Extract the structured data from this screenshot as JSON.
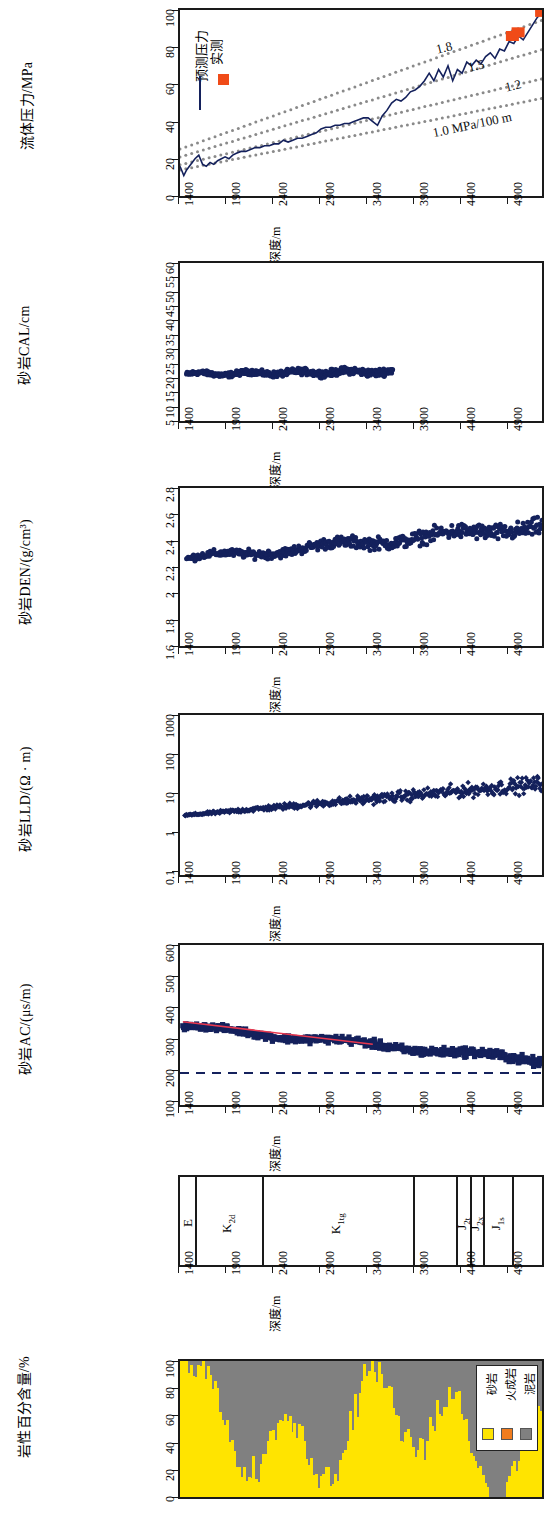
{
  "figure": {
    "orientation": "rotated-90",
    "depth_axis": {
      "label": "深度/m",
      "ticks": [
        1400,
        1900,
        2400,
        2900,
        3400,
        3900,
        4400,
        4900
      ],
      "min": 1400,
      "max": 5250
    },
    "colors": {
      "curve": "#14215c",
      "marker_measured": "#f04b18",
      "trend": "#e8384f",
      "sandstone": "#ffe400",
      "mudstone": "#808080",
      "igneous": "#f07c1e",
      "axis": "#1a1a1a"
    }
  },
  "panels": [
    {
      "id": "pressure",
      "ylabel": "流体压力/MPa",
      "yticks": [
        "0",
        "20",
        "40",
        "60",
        "80",
        "100"
      ],
      "ymin": 0,
      "ymax": 100,
      "legend": [
        {
          "label": "预测压力",
          "symbol": "line"
        },
        {
          "label": "实测",
          "symbol": "square"
        }
      ],
      "annotations": [
        {
          "text": "1.8"
        },
        {
          "text": "1.5"
        },
        {
          "text": "1.2"
        },
        {
          "text": "1.0 MPa/100 m"
        }
      ]
    },
    {
      "id": "cal",
      "ylabel": "砂岩CAL/cm",
      "yticks": [
        "5",
        "10",
        "15",
        "20",
        "25",
        "30",
        "35",
        "40",
        "45",
        "50",
        "55",
        "60"
      ],
      "ymin": 5,
      "ymax": 60
    },
    {
      "id": "den",
      "ylabel": "砂岩DEN/(g/cm³)",
      "yticks": [
        "1.6",
        "1.8",
        "2",
        "2.2",
        "2.4",
        "2.6",
        "2.8"
      ],
      "ymin": 1.6,
      "ymax": 2.8
    },
    {
      "id": "lld",
      "ylabel": "砂岩LLD/(Ω · m)",
      "yticks": [
        "0.1",
        "1",
        "10",
        "100",
        "1000"
      ],
      "ymin": 0.1,
      "ymax": 1000,
      "scale": "log"
    },
    {
      "id": "ac",
      "ylabel": "砂岩AC/(μs/m)",
      "yticks": [
        "100",
        "200",
        "300",
        "400",
        "500",
        "600"
      ],
      "ymin": 100,
      "ymax": 600
    },
    {
      "id": "strata",
      "units": [
        {
          "label": "E",
          "sub": "",
          "top": 1400,
          "base": 1560
        },
        {
          "label": "K",
          "sub": "2d",
          "top": 1560,
          "base": 2270
        },
        {
          "label": "K",
          "sub": "1tg",
          "top": 2270,
          "base": 3880
        },
        {
          "label": "",
          "sub": "",
          "top": 3880,
          "base": 4330
        },
        {
          "label": "J",
          "sub": "2t",
          "top": 4330,
          "base": 4480
        },
        {
          "label": "J",
          "sub": "2x",
          "top": 4480,
          "base": 4620
        },
        {
          "label": "J",
          "sub": "1s",
          "top": 4620,
          "base": 4930
        },
        {
          "label": "",
          "sub": "",
          "top": 4930,
          "base": 5250
        }
      ]
    },
    {
      "id": "lithology",
      "ylabel": "岩性百分含量/%",
      "yticks": [
        "0",
        "20",
        "40",
        "60",
        "80",
        "100"
      ],
      "ymin": 0,
      "ymax": 100,
      "legend": [
        {
          "label": "砂岩",
          "color": "#ffe400"
        },
        {
          "label": "火成岩",
          "color": "#f07c1e"
        },
        {
          "label": "泥岩",
          "color": "#808080"
        }
      ]
    }
  ],
  "chart_data": {
    "type": "line",
    "title": "",
    "xlabel": "深度/m",
    "x_ticks": [
      1400,
      1900,
      2400,
      2900,
      3400,
      3900,
      4400,
      4900
    ],
    "xlim": [
      1400,
      5250
    ],
    "grid": false,
    "subplots": [
      {
        "id": "pressure",
        "type": "line",
        "ylabel": "流体压力/MPa",
        "ylim": [
          0,
          100
        ],
        "y_ticks": [
          0,
          20,
          40,
          60,
          80,
          100
        ],
        "legend": [
          "预测压力",
          "实测"
        ],
        "legend_position": "upper-left",
        "annotations": [
          "1.8",
          "1.5",
          "1.2",
          "1.0 MPa/100 m"
        ],
        "series": [
          {
            "name": "预测压力",
            "style": "line",
            "color": "#14215c",
            "x": [
              1400,
              1440,
              1470,
              1500,
              1530,
              1560,
              1600,
              1640,
              1680,
              1720,
              1760,
              1800,
              1840,
              1880,
              1920,
              1960,
              2000,
              2050,
              2100,
              2150,
              2200,
              2250,
              2300,
              2350,
              2400,
              2450,
              2500,
              2550,
              2600,
              2650,
              2700,
              2750,
              2800,
              2850,
              2900,
              2950,
              3000,
              3050,
              3100,
              3150,
              3200,
              3250,
              3300,
              3350,
              3400,
              3450,
              3500,
              3550,
              3600,
              3650,
              3700,
              3750,
              3800,
              3850,
              3900,
              3950,
              4000,
              4050,
              4100,
              4150,
              4200,
              4250,
              4300,
              4350,
              4400,
              4450,
              4500,
              4550,
              4600,
              4650,
              4700,
              4750,
              4800,
              4850,
              4900,
              4950,
              5000,
              5050,
              5100,
              5150,
              5200,
              5250
            ],
            "y": [
              16,
              11,
              14,
              16,
              18,
              20,
              22,
              17,
              16,
              18,
              17,
              19,
              20,
              21,
              20,
              22,
              23,
              24,
              24,
              25,
              26,
              26,
              27,
              27,
              28,
              28,
              30,
              29,
              30,
              31,
              31,
              32,
              33,
              34,
              36,
              37,
              37,
              38,
              38,
              39,
              39,
              40,
              41,
              42,
              42,
              40,
              38,
              43,
              46,
              50,
              52,
              51,
              53,
              56,
              57,
              59,
              62,
              66,
              62,
              68,
              64,
              70,
              62,
              68,
              66,
              72,
              70,
              73,
              71,
              75,
              77,
              74,
              79,
              78,
              83,
              82,
              86,
              84,
              88,
              92,
              96,
              99
            ]
          },
          {
            "name": "实测",
            "style": "square-marker",
            "color": "#f04b18",
            "x": [
              4930,
              4990,
              5240
            ],
            "y": [
              86,
              88,
              99
            ]
          },
          {
            "name": "1.0 MPa/100 m",
            "style": "dotted-gradient",
            "color": "#8a8a8a",
            "gradient": 1.0
          },
          {
            "name": "1.2",
            "style": "dotted-gradient",
            "color": "#8a8a8a",
            "gradient": 1.2
          },
          {
            "name": "1.5",
            "style": "dotted-gradient",
            "color": "#8a8a8a",
            "gradient": 1.5
          },
          {
            "name": "1.8",
            "style": "dotted-gradient",
            "color": "#8a8a8a",
            "gradient": 1.8
          }
        ]
      },
      {
        "id": "cal",
        "type": "scatter",
        "ylabel": "砂岩CAL/cm",
        "ylim": [
          5,
          60
        ],
        "y_ticks": [
          5,
          10,
          15,
          20,
          25,
          30,
          35,
          40,
          45,
          50,
          55,
          60
        ],
        "note": "data present only 1470-3650 m, clustered near 20-24 cm",
        "series": [
          {
            "name": "CAL",
            "color": "#14215c",
            "marker": "circle",
            "x_range": [
              1470,
              3650
            ],
            "y_mean": 21.5,
            "y_range": [
              19,
              26
            ]
          }
        ]
      },
      {
        "id": "den",
        "type": "scatter",
        "ylabel": "砂岩DEN/(g/cm³)",
        "ylim": [
          1.6,
          2.8
        ],
        "y_ticks": [
          1.6,
          1.8,
          2.0,
          2.2,
          2.4,
          2.6,
          2.8
        ],
        "series": [
          {
            "name": "DEN",
            "color": "#14215c",
            "marker": "circle",
            "x_range": [
              1470,
              5250
            ],
            "trend_start": 2.25,
            "trend_end": 2.52,
            "y_range": [
              1.85,
              2.68
            ]
          }
        ]
      },
      {
        "id": "lld",
        "type": "scatter",
        "ylabel": "砂岩LLD/(Ω · m)",
        "ylim": [
          0.1,
          1000
        ],
        "yscale": "log",
        "y_ticks": [
          0.1,
          1,
          10,
          100,
          1000
        ],
        "series": [
          {
            "name": "LLD",
            "color": "#14215c",
            "marker": "diamond",
            "x_range": [
              1450,
              5250
            ],
            "trend_start": 3.2,
            "trend_end": 20,
            "y_range": [
              1.6,
              300
            ]
          }
        ]
      },
      {
        "id": "ac",
        "type": "scatter",
        "ylabel": "砂岩AC/(μs/m)",
        "ylim": [
          100,
          600
        ],
        "y_ticks": [
          100,
          200,
          300,
          400,
          500,
          600
        ],
        "series": [
          {
            "name": "AC",
            "color": "#14215c",
            "marker": "square",
            "x_range": [
              1430,
              5250
            ],
            "trend_start": 345,
            "trend_end": 235,
            "y_range": [
              195,
              385
            ]
          },
          {
            "name": "正常压实趋势线",
            "style": "line",
            "color": "#e8384f",
            "x": [
              1430,
              3450
            ],
            "y": [
              360,
              290
            ]
          },
          {
            "name": "基线",
            "style": "dashed-line",
            "color": "#14215c",
            "x": [
              1400,
              5250
            ],
            "y": [
              200,
              200
            ]
          }
        ]
      },
      {
        "id": "lithology",
        "type": "area",
        "ylabel": "岩性百分含量/%",
        "ylim": [
          0,
          100
        ],
        "y_ticks": [
          0,
          20,
          40,
          60,
          80,
          100
        ],
        "legend": [
          "砂岩",
          "火成岩",
          "泥岩"
        ],
        "legend_position": "upper-right",
        "series": [
          {
            "name": "砂岩",
            "color": "#ffe400"
          },
          {
            "name": "火成岩",
            "color": "#f07c1e"
          },
          {
            "name": "泥岩",
            "color": "#808080"
          }
        ]
      }
    ]
  }
}
